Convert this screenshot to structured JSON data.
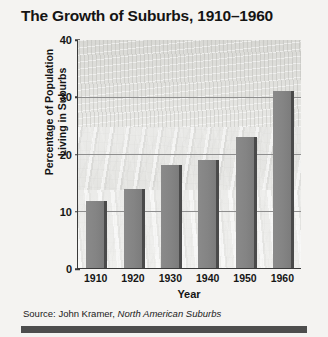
{
  "figure": {
    "title": "The Growth of Suburbs, 1910–1960",
    "source_prefix": "Source: John Kramer, ",
    "source_title": "North American Suburbs",
    "background_watermark": "aerial-suburb-photograph",
    "colors": {
      "page_background": "#f4f3f1",
      "plot_background": "#e9e9e7",
      "bar_fill": "#848484",
      "bar_shadow": "#4a4a4a",
      "axis_line": "#3a3a3a",
      "gridline": "#8e8e8e",
      "text": "#141414",
      "bottom_rule": "#4d4d4d"
    }
  },
  "chart_data": {
    "type": "bar",
    "title": "The Growth of Suburbs, 1910–1960",
    "xlabel": "Year",
    "ylabel": "Percentage of Population Living in Suburbs",
    "ylabel_line1": "Percentage of Population",
    "ylabel_line2": "Living in Suburbs",
    "categories": [
      "1910",
      "1920",
      "1930",
      "1940",
      "1950",
      "1960"
    ],
    "values": [
      11.8,
      13.8,
      18,
      19,
      23,
      31
    ],
    "ylim": [
      0,
      40
    ],
    "yticks": [
      0,
      10,
      20,
      30,
      40
    ],
    "ytick_labels": [
      "0",
      "10",
      "20",
      "30",
      "40"
    ],
    "gridlines": [
      10,
      20,
      30
    ],
    "grid": true,
    "legend": null,
    "units": "percent"
  }
}
